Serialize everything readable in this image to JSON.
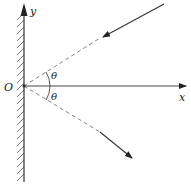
{
  "diagram": {
    "type": "reflection-geometry",
    "labels": {
      "origin": "O",
      "x_axis": "x",
      "y_axis": "y",
      "angle_upper": "θ",
      "angle_lower": "θ"
    },
    "elements": {
      "wall": "hatched vertical wall along y-axis",
      "incident_ray": "ray approaching origin from upper right, dashed near origin",
      "reflected_ray": "ray leaving origin toward lower right, dashed near origin",
      "angle_between": "equal angles θ above and below x-axis"
    },
    "colors": {
      "line": "#333333",
      "dashed": "#777777",
      "hatch": "#555555",
      "background": "#ffffff"
    }
  }
}
